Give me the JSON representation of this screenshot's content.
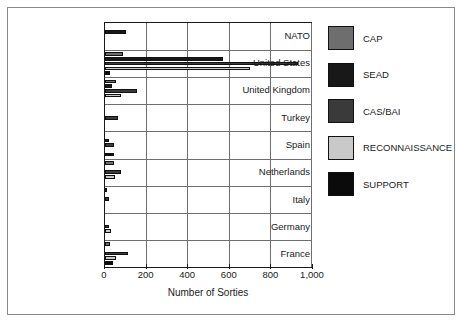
{
  "chart_data": {
    "type": "bar",
    "orientation": "horizontal",
    "title": "",
    "xlabel": "Number of Sorties",
    "ylabel": "",
    "xlim": [
      0,
      1000
    ],
    "xticks": [
      "0",
      "200",
      "400",
      "600",
      "800",
      "1,000"
    ],
    "xtick_values": [
      0,
      200,
      400,
      600,
      800,
      1000
    ],
    "grid": true,
    "legend_position": "right",
    "categories": [
      "NATO",
      "United States",
      "United Kingdom",
      "Turkey",
      "Spain",
      "Netherlands",
      "Italy",
      "Germany",
      "France"
    ],
    "series": [
      {
        "name": "CAP",
        "color": "#6e6e6e",
        "values": [
          0,
          85,
          55,
          0,
          0,
          45,
          8,
          0,
          25
        ]
      },
      {
        "name": "SEAD",
        "color": "#181818",
        "values": [
          100,
          575,
          35,
          0,
          20,
          0,
          0,
          0,
          0
        ]
      },
      {
        "name": "CAS/BAI",
        "color": "#3a3a3a",
        "values": [
          0,
          935,
          155,
          65,
          45,
          80,
          20,
          20,
          110
        ]
      },
      {
        "name": "RECONNAISSANCE",
        "color": "#c9c9c9",
        "values": [
          0,
          705,
          80,
          0,
          0,
          50,
          0,
          30,
          55
        ]
      },
      {
        "name": "SUPPORT",
        "color": "#0b0b0b",
        "values": [
          0,
          25,
          0,
          0,
          45,
          0,
          0,
          0,
          40
        ]
      }
    ]
  },
  "legend": {
    "items": [
      {
        "label": "CAP",
        "color": "#6e6e6e"
      },
      {
        "label": "SEAD",
        "color": "#181818"
      },
      {
        "label": "CAS/BAI",
        "color": "#3a3a3a"
      },
      {
        "label": "RECONNAISSANCE",
        "color": "#c9c9c9"
      },
      {
        "label": "SUPPORT",
        "color": "#0b0b0b"
      }
    ]
  }
}
